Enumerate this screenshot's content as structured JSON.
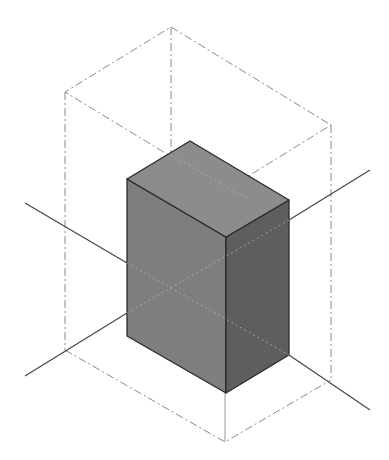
{
  "diagram": {
    "type": "isometric-3d-box",
    "colors": {
      "background": "#ffffff",
      "top_face": "#8c8c8c",
      "left_face": "#7e7e7e",
      "right_face": "#5e5e5e",
      "edge": "#2a2a2a",
      "axis": "#4a4a4a",
      "bounding_box": "#8a8a8a"
    },
    "box": {
      "top": [
        [
          190,
          141
        ],
        [
          289,
          200
        ],
        [
          226,
          237
        ],
        [
          127,
          179
        ]
      ],
      "left_face": [
        [
          127,
          179
        ],
        [
          226,
          237
        ],
        [
          226,
          393
        ],
        [
          127,
          336
        ]
      ],
      "right_face": [
        [
          226,
          237
        ],
        [
          289,
          200
        ],
        [
          289,
          355
        ],
        [
          226,
          393
        ]
      ]
    },
    "bounding_box": {
      "top": [
        [
          171,
          27
        ],
        [
          331,
          125
        ],
        [
          226,
          190
        ],
        [
          65,
          92
        ]
      ],
      "bottom": [
        [
          171,
          290
        ],
        [
          331,
          380
        ],
        [
          225,
          442
        ],
        [
          65,
          350
        ]
      ]
    },
    "axes": [
      {
        "from": [
          25,
          203
        ],
        "to": [
          127,
          263
        ]
      },
      {
        "from": [
          289,
          220
        ],
        "to": [
          370,
          170
        ]
      },
      {
        "from": [
          25,
          376
        ],
        "to": [
          127,
          313
        ]
      },
      {
        "from": [
          289,
          355
        ],
        "to": [
          370,
          410
        ]
      }
    ]
  }
}
